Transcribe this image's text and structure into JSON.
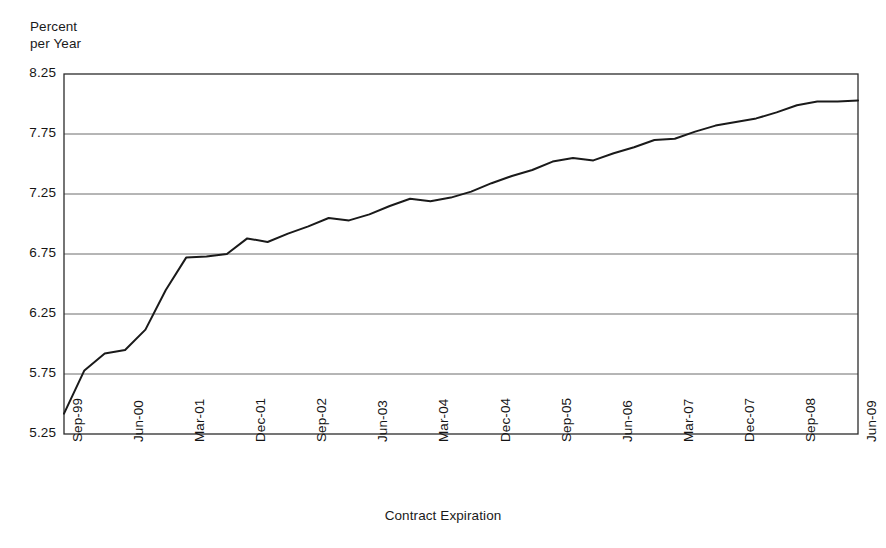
{
  "chart_data": {
    "type": "line",
    "title": "",
    "xlabel": "Contract Expiration",
    "ylabel": "Percent\nper Year",
    "ylim": [
      5.25,
      8.25
    ],
    "ytick_values": [
      8.25,
      7.75,
      7.25,
      6.75,
      6.25,
      5.75,
      5.25
    ],
    "ytick_labels": [
      "8.25",
      "7.75",
      "7.25",
      "6.75",
      "6.25",
      "5.75",
      "5.25"
    ],
    "grid": "horizontal",
    "legend": "none",
    "line_color": "#1a1a1a",
    "x": [
      "Sep-99",
      "Dec-99",
      "Mar-00",
      "Jun-00",
      "Sep-00",
      "Dec-00",
      "Mar-01",
      "Jun-01",
      "Sep-01",
      "Dec-01",
      "Mar-02",
      "Jun-02",
      "Sep-02",
      "Dec-02",
      "Mar-03",
      "Jun-03",
      "Sep-03",
      "Dec-03",
      "Mar-04",
      "Jun-04",
      "Sep-04",
      "Dec-04",
      "Mar-05",
      "Jun-05",
      "Sep-05",
      "Dec-05",
      "Mar-06",
      "Jun-06",
      "Sep-06",
      "Dec-06",
      "Mar-07",
      "Jun-07",
      "Sep-07",
      "Dec-07",
      "Mar-08",
      "Jun-08",
      "Sep-08",
      "Dec-08",
      "Mar-09",
      "Jun-09"
    ],
    "xtick_labels": [
      "Sep-99",
      "Jun-00",
      "Mar-01",
      "Dec-01",
      "Sep-02",
      "Jun-03",
      "Mar-04",
      "Dec-04",
      "Sep-05",
      "Jun-06",
      "Mar-07",
      "Dec-07",
      "Sep-08",
      "Jun-09"
    ],
    "xtick_indices": [
      0,
      3,
      6,
      9,
      12,
      15,
      18,
      21,
      24,
      27,
      30,
      33,
      36,
      39
    ],
    "values": [
      5.42,
      5.78,
      5.92,
      5.95,
      6.12,
      6.45,
      6.72,
      6.73,
      6.75,
      6.88,
      6.85,
      6.92,
      6.98,
      7.05,
      7.03,
      7.08,
      7.15,
      7.21,
      7.19,
      7.22,
      7.27,
      7.34,
      7.4,
      7.45,
      7.52,
      7.55,
      7.53,
      7.59,
      7.64,
      7.7,
      7.71,
      7.77,
      7.82,
      7.85,
      7.88,
      7.93,
      7.99,
      8.02,
      8.02,
      8.03
    ]
  },
  "axis": {
    "y_title": "Percent\nper Year",
    "x_title": "Contract Expiration"
  }
}
